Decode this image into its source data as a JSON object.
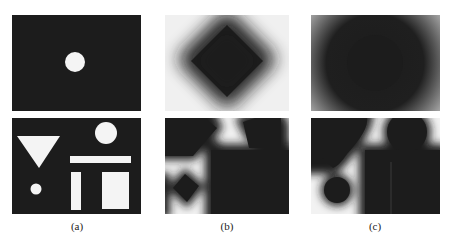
{
  "figure": {
    "panels": [
      {
        "label": "(a)",
        "description": "binary input images"
      },
      {
        "label": "(b)",
        "description": "distance transform, diamond-shaped (city-block) metric"
      },
      {
        "label": "(c)",
        "description": "distance transform, circular (Euclidean) metric"
      }
    ],
    "colors": {
      "background": "#ffffff",
      "object_black": "#1c1c1c",
      "shape_white": "#f4f4f4",
      "far_gray": "#e8e8e8"
    }
  }
}
